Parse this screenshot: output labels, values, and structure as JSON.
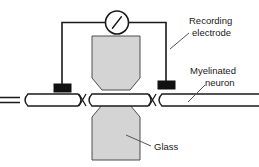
{
  "figure": {
    "background_color": "#ffffff",
    "width": 259,
    "height": 167
  },
  "colors": {
    "stroke": "#1a1a1a",
    "glass_fill": "#d4d4d4",
    "glass_stroke": "#4d4d4d",
    "neuron_fill": "#ffffff",
    "neuron_stroke": "#1a1a1a",
    "electrode_fill": "#111111",
    "wire": "#1a1a1a",
    "leader_line": "#555555",
    "text": "#1a1a1a"
  },
  "labels": {
    "recording_electrode_line1": "Recording",
    "recording_electrode_line2": "electrode",
    "myelinated_neuron_line1": "Myelinated",
    "myelinated_neuron_line2": "neuron",
    "glass": "Glass"
  },
  "components": {
    "meter_name": "voltmeter",
    "left_electrode_name": "left recording electrode",
    "right_electrode_name": "right recording electrode",
    "upper_glass_name": "upper glass pipette",
    "lower_glass_name": "lower glass pipette",
    "neuron_name": "myelinated axon with nodes of Ranvier"
  }
}
